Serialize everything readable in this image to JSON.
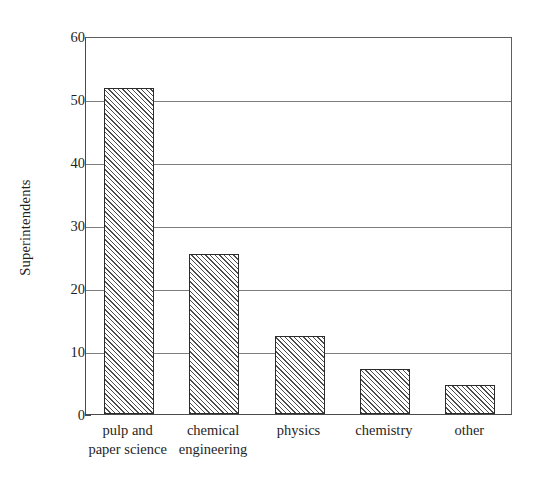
{
  "chart_data": {
    "type": "bar",
    "title": "",
    "xlabel": "",
    "ylabel": "Superintendents",
    "categories": [
      "pulp and\npaper science",
      "chemical\nengineering",
      "physics",
      "chemistry",
      "other"
    ],
    "values": [
      51.8,
      25.4,
      12.4,
      7.1,
      4.6
    ],
    "ylim": [
      0,
      60
    ],
    "ytick_labels": [
      "0",
      "10",
      "20",
      "30",
      "40",
      "50",
      "60"
    ],
    "ytick_values": [
      0,
      10,
      20,
      30,
      40,
      50,
      60
    ],
    "grid": "horizontal",
    "legend": "none",
    "bar_fill": "diagonal-hatch",
    "bar_fill_color": "#4c4c4c",
    "bar_edge_color": "#2b2b2b",
    "axis_color": "#4a4a4a",
    "grid_color": "#7d7d7d",
    "background": "#ffffff"
  }
}
